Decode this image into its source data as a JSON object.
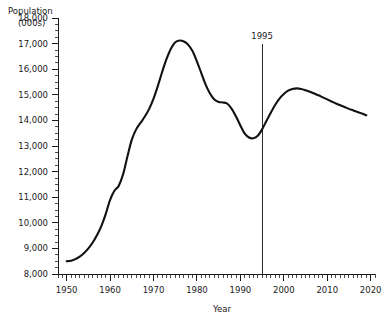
{
  "chart_data": {
    "type": "line",
    "title": "Population (000s)",
    "title_line1": "Population",
    "title_line2": "(000s)",
    "xlabel": "Year",
    "ylabel": "Population (000s)",
    "xlim": [
      1948,
      2021
    ],
    "ylim": [
      8000,
      18000
    ],
    "grid": false,
    "legend": null,
    "legend_position": "none",
    "x_tick_labels": [
      "1950",
      "1960",
      "1970",
      "1980",
      "1990",
      "2000",
      "2010",
      "2020"
    ],
    "x_ticks": [
      1950,
      1960,
      1970,
      1980,
      1990,
      2000,
      2010,
      2020
    ],
    "x_minor_tick_interval": 1,
    "y_tick_labels": [
      "8,000",
      "9,000",
      "10,000",
      "11,000",
      "12,000",
      "13,000",
      "14,000",
      "15,000",
      "16,000",
      "17,000",
      "18,000"
    ],
    "y_ticks": [
      8000,
      9000,
      10000,
      11000,
      12000,
      13000,
      14000,
      15000,
      16000,
      17000,
      18000
    ],
    "y_minor_tick_interval": 250,
    "annotations": [
      {
        "name": "reference-line-1995",
        "label": "1995",
        "x": 1995,
        "type": "vertical-line",
        "color": "#2b2b2b"
      }
    ],
    "series": [
      {
        "name": "Population",
        "color": "#111111",
        "x": [
          1950,
          1951,
          1952,
          1953,
          1954,
          1955,
          1956,
          1957,
          1958,
          1959,
          1960,
          1961,
          1962,
          1963,
          1964,
          1965,
          1966,
          1967,
          1968,
          1969,
          1970,
          1971,
          1972,
          1973,
          1974,
          1975,
          1976,
          1977,
          1978,
          1979,
          1980,
          1981,
          1982,
          1983,
          1984,
          1985,
          1986,
          1987,
          1988,
          1989,
          1990,
          1991,
          1992,
          1993,
          1994,
          1995,
          1996,
          1997,
          1998,
          1999,
          2000,
          2001,
          2002,
          2003,
          2004,
          2005,
          2006,
          2007,
          2008,
          2009,
          2010,
          2011,
          2012,
          2013,
          2014,
          2015,
          2016,
          2017,
          2018,
          2019
        ],
        "values": [
          8500,
          8520,
          8580,
          8680,
          8820,
          9000,
          9230,
          9520,
          9880,
          10350,
          10900,
          11250,
          11450,
          11900,
          12600,
          13250,
          13650,
          13900,
          14150,
          14450,
          14850,
          15350,
          15900,
          16400,
          16800,
          17050,
          17120,
          17080,
          16950,
          16700,
          16300,
          15850,
          15400,
          15050,
          14820,
          14720,
          14700,
          14650,
          14450,
          14150,
          13800,
          13480,
          13330,
          13300,
          13400,
          13650,
          13980,
          14300,
          14600,
          14850,
          15030,
          15160,
          15230,
          15250,
          15230,
          15180,
          15120,
          15050,
          14980,
          14900,
          14820,
          14740,
          14660,
          14590,
          14520,
          14450,
          14390,
          14330,
          14270,
          14200
        ]
      }
    ]
  }
}
